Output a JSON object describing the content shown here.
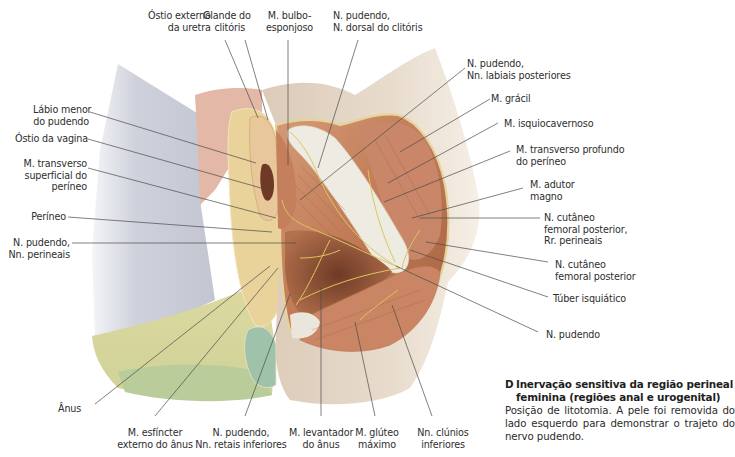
{
  "figure": {
    "letter": "D",
    "title": "Inervação sensitiva da região perineal feminina (regiões anal e urogenital)",
    "description": "Posição de litotomia. A pele foi removida do lado esquerdo para demonstrar o trajeto do nervo pudendo."
  },
  "labels": {
    "top": [
      {
        "id": "ostio-externo-uretra",
        "text": "Óstio externo\n   da uretra"
      },
      {
        "id": "glande-clitoris",
        "text": "Glande do\n  clitóris"
      },
      {
        "id": "m-bulboesponjoso",
        "text": "M. bulbo-\nesponjoso"
      },
      {
        "id": "n-pudendo-dorsal-clitoris",
        "text": "N. pudendo,\nN. dorsal do clitóris"
      }
    ],
    "left": [
      {
        "id": "labio-menor",
        "text": "Lábio menor\ndo pudendo"
      },
      {
        "id": "ostio-vagina",
        "text": "Óstio da vagina"
      },
      {
        "id": "m-transverso-superficial",
        "text": "M. transverso\nsuperficial do\nperíneo"
      },
      {
        "id": "perineo",
        "text": "Períneo"
      },
      {
        "id": "n-pudendo-perineais",
        "text": "N. pudendo,\nNn. perineais"
      }
    ],
    "right": [
      {
        "id": "n-pudendo-labiais",
        "text": "N. pudendo,\nNn. labiais posteriores"
      },
      {
        "id": "m-gracil",
        "text": "M. grácil"
      },
      {
        "id": "m-isquiocavernoso",
        "text": "M. isquiocavernoso"
      },
      {
        "id": "m-transverso-profundo",
        "text": "M. transverso profundo\ndo períneo"
      },
      {
        "id": "m-adutor-magno",
        "text": "M. adutor\nmagno"
      },
      {
        "id": "n-cutaneo-femoral-rr",
        "text": "N. cutâneo\nfemoral posterior,\nRr. perineais"
      },
      {
        "id": "n-cutaneo-femoral",
        "text": "N. cutâneo\nfemoral posterior"
      },
      {
        "id": "tuber-isquiatico",
        "text": "Túber isquiático"
      },
      {
        "id": "n-pudendo",
        "text": "N. pudendo"
      }
    ],
    "bottom": [
      {
        "id": "anus",
        "text": "Ânus"
      },
      {
        "id": "m-esfincter-externo",
        "text": "M. esfíncter\nexterno do ânus"
      },
      {
        "id": "n-pudendo-retais",
        "text": "N. pudendo,\nNn. retais inferiores"
      },
      {
        "id": "m-levantador-anus",
        "text": "M. levantador\ndo ânus"
      },
      {
        "id": "m-gluteo-maximo",
        "text": "M. glúteo\nmáximo"
      },
      {
        "id": "nn-clunios-inferiores",
        "text": "Nn. clúnios\ninferiores"
      }
    ]
  },
  "colors": {
    "skin": "#e9ddd0",
    "skin_shadow": "#d4c3b1",
    "thigh_grey": "#c9ccd6",
    "labia_pink": "#e4b8a6",
    "labia_yellow": "#ead39a",
    "zone_yellow": "#d8d79a",
    "zone_green": "#b9cc9a",
    "zone_teal": "#9fc3aa",
    "muscle": "#c5825e",
    "muscle_dark": "#9c5a3e",
    "fascia_white": "#eeece2",
    "nerve": "#d9c45a",
    "leader_line": "#4a4a4a"
  }
}
